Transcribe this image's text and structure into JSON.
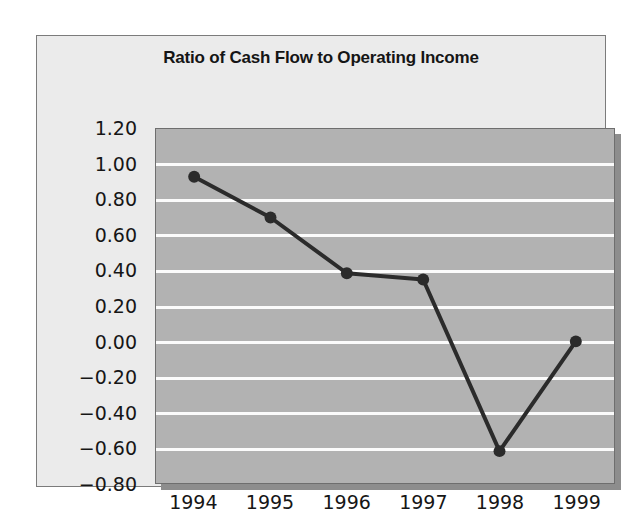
{
  "chart_data": {
    "type": "line",
    "title": "Ratio of Cash Flow to Operating Income",
    "xlabel": "",
    "ylabel": "",
    "categories": [
      "1994",
      "1995",
      "1996",
      "1997",
      "1998",
      "1999"
    ],
    "values": [
      0.93,
      0.7,
      0.385,
      0.35,
      -0.62,
      0.0
    ],
    "series": [
      {
        "name": "Ratio of Cash Flow to Operating Income",
        "values": [
          0.93,
          0.7,
          0.385,
          0.35,
          -0.62,
          0.0
        ]
      }
    ],
    "ylim": [
      -0.8,
      1.2
    ],
    "yticks": [
      1.2,
      1.0,
      0.8,
      0.6,
      0.4,
      0.2,
      0.0,
      -0.2,
      -0.4,
      -0.6,
      -0.8
    ],
    "ytick_labels": [
      "1.20",
      "1.00",
      "0.80",
      "0.60",
      "0.40",
      "0.20",
      "0.00",
      "−0.20",
      "−0.40",
      "−0.60",
      "−0.80"
    ],
    "xtick_labels": [
      "1994",
      "1995",
      "1996",
      "1997",
      "1998",
      "1999"
    ],
    "grid": true,
    "grid_orientation": "horizontal",
    "legend": false,
    "legend_position": "none",
    "marker": "circle",
    "colors": {
      "line": "#2b2b2b",
      "marker": "#2b2b2b",
      "plot_background": "#b2b2b2",
      "panel_background": "#ebebeb",
      "gridline": "#fbfbfb",
      "text": "#161616",
      "border": "#6e6e6e",
      "shadow": "#8d8d8d"
    }
  }
}
